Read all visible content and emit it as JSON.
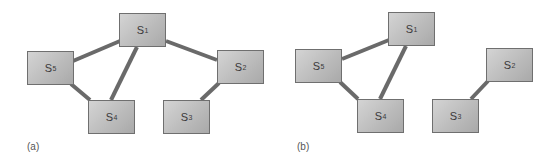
{
  "panels": [
    {
      "label": "(a)",
      "nodes": [
        {
          "id": "S1",
          "base": "S",
          "sub": "1"
        },
        {
          "id": "S2",
          "base": "S",
          "sub": "2"
        },
        {
          "id": "S3",
          "base": "S",
          "sub": "3"
        },
        {
          "id": "S4",
          "base": "S",
          "sub": "4"
        },
        {
          "id": "S5",
          "base": "S",
          "sub": "5"
        }
      ],
      "edges": [
        [
          "S1",
          "S5"
        ],
        [
          "S1",
          "S4"
        ],
        [
          "S1",
          "S2"
        ],
        [
          "S5",
          "S4"
        ],
        [
          "S2",
          "S3"
        ]
      ]
    },
    {
      "label": "(b)",
      "nodes": [
        {
          "id": "S1",
          "base": "S",
          "sub": "1"
        },
        {
          "id": "S2",
          "base": "S",
          "sub": "2"
        },
        {
          "id": "S3",
          "base": "S",
          "sub": "3"
        },
        {
          "id": "S4",
          "base": "S",
          "sub": "4"
        },
        {
          "id": "S5",
          "base": "S",
          "sub": "5"
        }
      ],
      "edges": [
        [
          "S1",
          "S5"
        ],
        [
          "S1",
          "S4"
        ],
        [
          "S5",
          "S4"
        ],
        [
          "S2",
          "S3"
        ]
      ]
    }
  ],
  "colors": {
    "edge": "#6a6a6a",
    "node_border": "#6f6f6f",
    "text": "#3a3a3a"
  }
}
